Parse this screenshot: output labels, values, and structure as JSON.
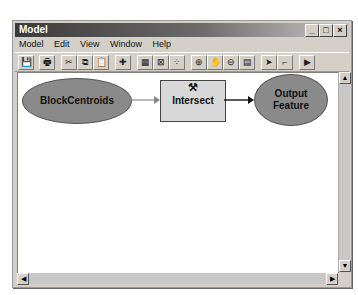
{
  "window": {
    "title": "Model",
    "controls": {
      "minimize": "_",
      "maximize": "□",
      "close": "×"
    }
  },
  "menubar": {
    "items": [
      "Model",
      "Edit",
      "View",
      "Window",
      "Help"
    ]
  },
  "toolbar": {
    "buttons": [
      {
        "name": "save",
        "glyph": "💾"
      },
      {
        "name": "print",
        "glyph": "🖶"
      },
      {
        "name": "cut",
        "glyph": "✂"
      },
      {
        "name": "copy",
        "glyph": "⧉"
      },
      {
        "name": "paste",
        "glyph": "📋"
      },
      {
        "name": "add-data",
        "glyph": "✚"
      },
      {
        "name": "full-extent",
        "glyph": "▦"
      },
      {
        "name": "fit-to-window",
        "glyph": "⊠"
      },
      {
        "name": "grid",
        "glyph": "⁘"
      },
      {
        "name": "zoom-in",
        "glyph": "⊕"
      },
      {
        "name": "pan",
        "glyph": "✋"
      },
      {
        "name": "zoom-out",
        "glyph": "⊖"
      },
      {
        "name": "properties",
        "glyph": "▤"
      },
      {
        "name": "select",
        "glyph": "➤"
      },
      {
        "name": "connect",
        "glyph": "⌐"
      },
      {
        "name": "run",
        "glyph": "▶"
      }
    ]
  },
  "diagram": {
    "input": {
      "label": "BlockCentroids"
    },
    "tool": {
      "label": "Intersect",
      "icon": "hammer-icon"
    },
    "output": {
      "label_line1": "Output",
      "label_line2": "Feature"
    }
  },
  "scrollbars": {
    "up": "▲",
    "down": "▼",
    "left": "◀",
    "right": "▶"
  }
}
